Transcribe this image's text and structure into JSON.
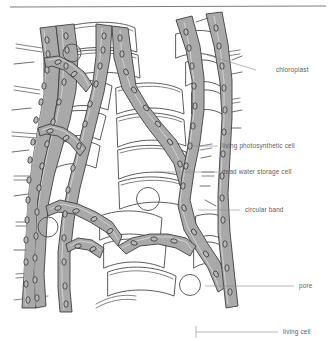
{
  "figure": {
    "top_rule": true,
    "background_color": "#ffffff",
    "band_fill_color": "#a9a9a9",
    "wall_stroke_color": "#4a4a4a",
    "chloroplast_fill_color": "#b9b9b9",
    "label_text_color": "#5e5e5e"
  },
  "labels": [
    {
      "id": "chloroplast",
      "text": "chloroplast",
      "text_x": 276,
      "text_y": 72,
      "leader_x1": 256,
      "leader_y1": 70,
      "leader_x2": 207,
      "leader_y2": 55
    },
    {
      "id": "living-photosynthetic",
      "text": "living photosynthetic cell",
      "text_x": 222,
      "text_y": 148,
      "leader_x1": 218,
      "leader_y1": 146,
      "leader_x2": 193,
      "leader_y2": 146
    },
    {
      "id": "dead-water-storage",
      "text": "dead water storage cell",
      "text_x": 222,
      "text_y": 174,
      "leader_x1": 218,
      "leader_y1": 172,
      "leader_x2": 155,
      "leader_y2": 172
    },
    {
      "id": "circular-band",
      "text": "circular band",
      "text_x": 245,
      "text_y": 212,
      "leader_x1": 240,
      "leader_y1": 210,
      "leader_x2": 198,
      "leader_y2": 210
    },
    {
      "id": "pore",
      "text": "pore",
      "text_x": 299,
      "text_y": 288,
      "leader_x1": 294,
      "leader_y1": 286,
      "leader_x2": 205,
      "leader_y2": 286
    },
    {
      "id": "living-cell",
      "text": "living cell",
      "text_x": 283,
      "text_y": 334,
      "leader_x1": 278,
      "leader_y1": 332,
      "leader_x2": 196,
      "leader_y2": 332
    }
  ],
  "legend_bracket": {
    "x": 196,
    "y_top": 325,
    "y_bottom": 338
  },
  "structures": {
    "chloroplast_count": 96,
    "pore_count": 5,
    "band_count": 9,
    "description": "Gray shaded bands represent living photosynthetic cells containing chloroplasts; large white polygons are dead water storage cells bearing pores and circular bands."
  }
}
